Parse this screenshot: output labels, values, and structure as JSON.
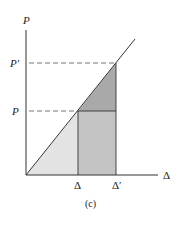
{
  "figure": {
    "caption": "(c)",
    "y_axis_label": "P",
    "x_axis_label": "Δ",
    "y_ticks": [
      {
        "label": "P′",
        "y": 63
      },
      {
        "label": "P",
        "y": 111
      }
    ],
    "x_ticks": [
      {
        "label": "Δ",
        "x": 78
      },
      {
        "label": "Δ′",
        "x": 116
      }
    ],
    "colors": {
      "light_triangle": "#e3e3e3",
      "mid_rectangle": "#c4c4c4",
      "dark_triangle": "#a9a9a9",
      "line": "#333333"
    }
  }
}
